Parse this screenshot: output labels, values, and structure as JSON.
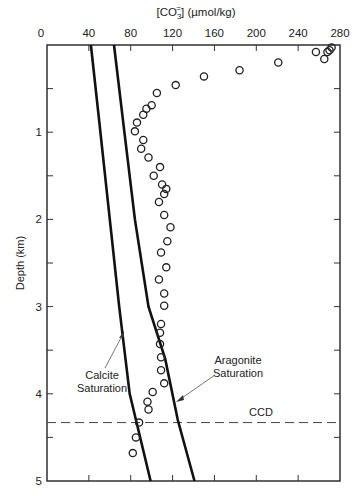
{
  "chart_data": {
    "type": "scatter",
    "title": "",
    "xlabel": "[CO3=] (µmol/kg)",
    "xlabel_main": "[CO",
    "xlabel_sub": "3",
    "xlabel_sup": "=",
    "xlabel_rest": "] (µmol/kg)",
    "ylabel": "Depth (km)",
    "xlim": [
      0,
      280
    ],
    "ylim": [
      0,
      5
    ],
    "x_axis_position": "top",
    "y_inverted": true,
    "x_ticks": [
      "0",
      "40",
      "80",
      "120",
      "160",
      "200",
      "240",
      "280"
    ],
    "y_ticks": [
      "1",
      "2",
      "3",
      "4",
      "5"
    ],
    "grid": false,
    "series": [
      {
        "name": "Measured carbonate ion",
        "marker": "open-circle",
        "points": [
          [
            272,
            0.03
          ],
          [
            270,
            0.06
          ],
          [
            268,
            0.08
          ],
          [
            265,
            0.16
          ],
          [
            257,
            0.08
          ],
          [
            221,
            0.2
          ],
          [
            184,
            0.29
          ],
          [
            150,
            0.36
          ],
          [
            123,
            0.46
          ],
          [
            105,
            0.55
          ],
          [
            100,
            0.69
          ],
          [
            95,
            0.73
          ],
          [
            92,
            0.8
          ],
          [
            86,
            0.89
          ],
          [
            84,
            0.99
          ],
          [
            92,
            1.09
          ],
          [
            90,
            1.19
          ],
          [
            97,
            1.29
          ],
          [
            108,
            1.4
          ],
          [
            102,
            1.5
          ],
          [
            110,
            1.6
          ],
          [
            114,
            1.65
          ],
          [
            112,
            1.71
          ],
          [
            107,
            1.8
          ],
          [
            112,
            1.95
          ],
          [
            118,
            2.09
          ],
          [
            115,
            2.25
          ],
          [
            109,
            2.38
          ],
          [
            114,
            2.55
          ],
          [
            107,
            2.69
          ],
          [
            112,
            2.85
          ],
          [
            112,
            2.99
          ],
          [
            109,
            3.2
          ],
          [
            108,
            3.3
          ],
          [
            108,
            3.43
          ],
          [
            109,
            3.58
          ],
          [
            109,
            3.73
          ],
          [
            112,
            3.88
          ],
          [
            101,
            3.98
          ],
          [
            96,
            4.09
          ],
          [
            97,
            4.18
          ],
          [
            88,
            4.33
          ],
          [
            85,
            4.5
          ],
          [
            82,
            4.68
          ]
        ]
      },
      {
        "name": "Calcite Saturation",
        "style": "solid-line",
        "points": [
          [
            42,
            0
          ],
          [
            51,
            1
          ],
          [
            60,
            2
          ],
          [
            69,
            3
          ],
          [
            79,
            4
          ],
          [
            99,
            5
          ]
        ]
      },
      {
        "name": "Aragonite Saturation",
        "style": "solid-line",
        "points": [
          [
            64,
            0
          ],
          [
            74,
            1
          ],
          [
            84,
            2
          ],
          [
            97,
            3
          ],
          [
            113,
            3.6
          ],
          [
            125,
            4.3
          ],
          [
            141,
            5
          ]
        ]
      }
    ],
    "annotations": [
      {
        "text_line1": "Calcite",
        "text_line2": "Saturation",
        "points_to": "Calcite Saturation line"
      },
      {
        "text_line1": "Aragonite",
        "text_line2": "Saturation",
        "points_to": "Aragonite Saturation line"
      },
      {
        "text": "CCD",
        "type": "horizontal-dashed-line",
        "y": 4.33
      }
    ]
  }
}
